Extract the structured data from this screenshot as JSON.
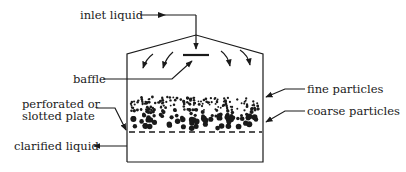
{
  "diagram": {
    "title": "",
    "labels": {
      "inlet": "inlet liquid",
      "baffle": "baffle",
      "plate_line1": "perforated or",
      "plate_line2": "slotted plate",
      "clarified": "clarified liquid",
      "fine": "fine particles",
      "coarse": "coarse particles"
    },
    "colors": {
      "ink": "#1a1a1a",
      "background": "#ffffff"
    }
  }
}
